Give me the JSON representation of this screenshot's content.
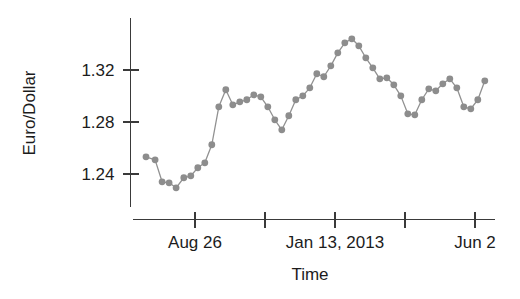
{
  "chart_data": {
    "type": "line",
    "title": "",
    "subtitle": "",
    "xlabel": "Time",
    "ylabel": "Euro/Dollar",
    "grid": false,
    "legend": null,
    "legend_position": "none",
    "marker": "filled-circle",
    "marker_color": "#8d8d8d",
    "line_color": "#919191",
    "axis_color": "#3a3a3a",
    "ylim": [
      1.2185,
      1.3638
    ],
    "yticks": [
      1.24,
      1.28,
      1.32
    ],
    "ytick_labels": [
      "1.24",
      "1.28",
      "1.32"
    ],
    "xlim": [
      0,
      50
    ],
    "xticks": [
      8,
      18,
      28,
      38,
      48
    ],
    "xtick_labels": [
      "",
      "Aug 26",
      "",
      "Jan 13, 2013",
      "",
      "Jun 2"
    ],
    "xtick_labeled": [
      {
        "index": 8,
        "label": "Aug 26"
      },
      {
        "index": 28,
        "label": "Jan 13, 2013"
      },
      {
        "index": 48,
        "label": "Jun 2"
      }
    ],
    "xtick_unlabeled": [
      18,
      38
    ],
    "series": [
      {
        "name": "Euro/Dollar",
        "x": [
          1.0,
          2.3,
          3.3,
          4.3,
          5.3,
          6.4,
          7.4,
          8.4,
          9.4,
          10.4,
          11.4,
          12.4,
          13.4,
          14.4,
          15.4,
          16.4,
          17.4,
          18.4,
          19.4,
          20.4,
          21.4,
          22.4,
          23.4,
          24.4,
          25.4,
          26.4,
          27.4,
          28.4,
          29.4,
          30.4,
          31.4,
          32.4,
          33.4,
          34.4,
          35.4,
          36.4,
          37.4,
          38.4,
          39.4,
          40.4,
          41.4,
          42.4,
          43.4,
          44.4,
          45.4,
          46.4,
          47.4,
          48.4,
          49.4
        ],
        "values": [
          1.2532,
          1.2509,
          1.234,
          1.2332,
          1.2294,
          1.2371,
          1.2386,
          1.2448,
          1.2486,
          1.2625,
          1.2917,
          1.3048,
          1.2932,
          1.2955,
          1.2971,
          1.3009,
          1.2994,
          1.2917,
          1.2817,
          1.274,
          1.2848,
          1.2971,
          1.3001,
          1.3063,
          1.3171,
          1.3148,
          1.3232,
          1.3332,
          1.3409,
          1.344,
          1.3386,
          1.3294,
          1.3217,
          1.3132,
          1.314,
          1.3086,
          1.3001,
          1.2863,
          1.2855,
          1.2971,
          1.3055,
          1.304,
          1.3094,
          1.3132,
          1.3063,
          1.2917,
          1.2901,
          1.2971,
          1.3117
        ]
      }
    ]
  },
  "axes": {
    "ylabel": "Euro/Dollar",
    "xlabel": "Time"
  }
}
